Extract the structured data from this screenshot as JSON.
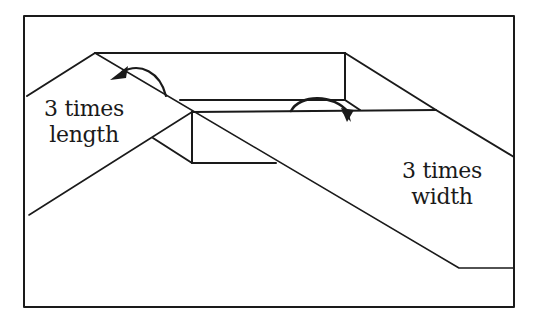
{
  "diagram": {
    "type": "folding-diagram",
    "labels": {
      "length": {
        "line1": "3 times",
        "line2": "length"
      },
      "width": {
        "line1": "3 times",
        "line2": "width"
      }
    },
    "colors": {
      "stroke": "#1a1a1a",
      "background": "#ffffff"
    }
  }
}
